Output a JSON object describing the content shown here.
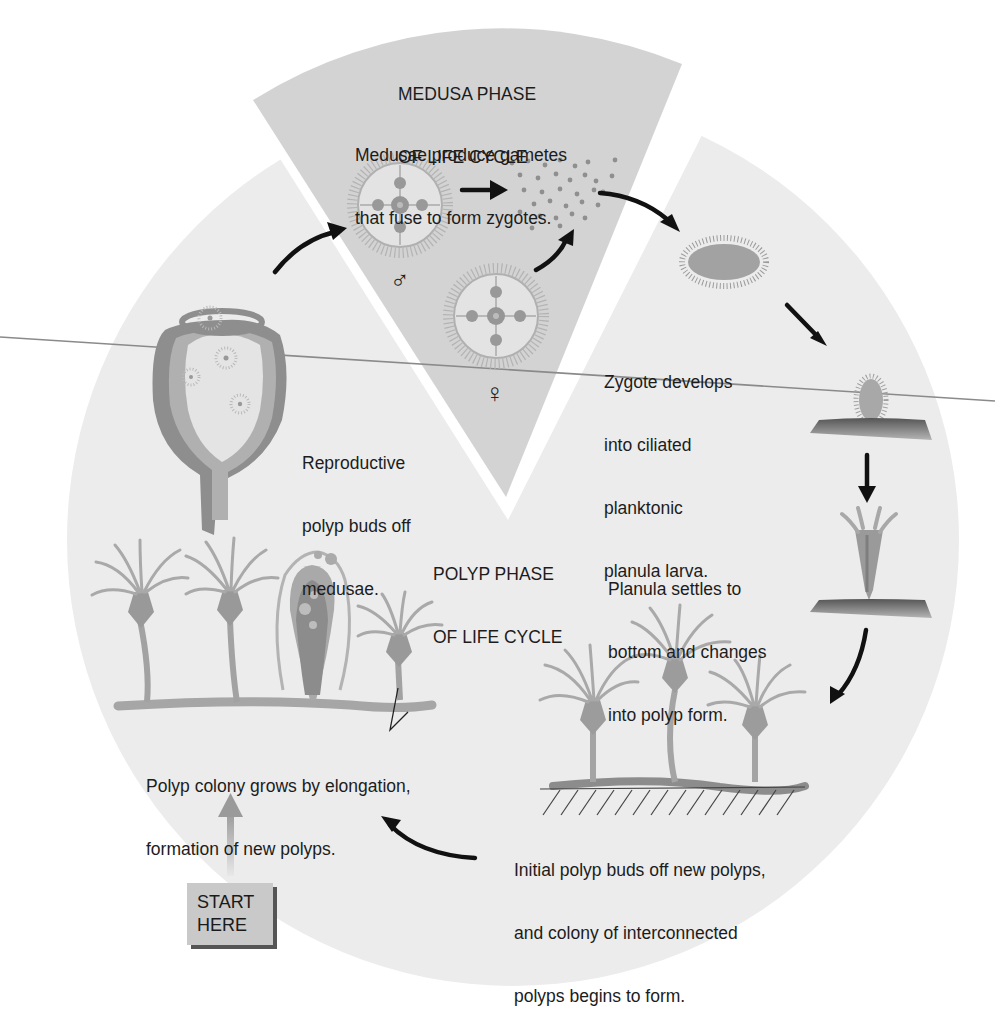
{
  "diagram": {
    "title_medusa_phase": [
      "MEDUSA PHASE",
      "OF LIFE CYCLE"
    ],
    "title_polyp_phase": [
      "POLYP PHASE",
      "OF LIFE CYCLE"
    ],
    "start_label": [
      "START",
      "HERE"
    ],
    "symbols": {
      "male": "♂",
      "female": "♀"
    },
    "captions": {
      "gametes": [
        "Medusae produce gametes",
        "that fuse to form zygotes."
      ],
      "planula": [
        "Zygote develops",
        "into ciliated",
        "planktonic",
        "planula larva."
      ],
      "reproductive_polyp": [
        "Reproductive",
        "polyp buds off",
        "medusae."
      ],
      "settles": [
        "Planula settles to",
        "bottom and changes",
        "into polyp form."
      ],
      "colony_grows": [
        "Polyp colony grows by elongation,",
        "formation of new polyps."
      ],
      "initial_polyp": [
        "Initial polyp buds off new polyps,",
        "and colony of interconnected",
        "polyps begins to form."
      ]
    },
    "stages": [
      "reproductive-polyp",
      "male-medusa",
      "female-medusa",
      "gametes-zygotes",
      "planula-larva",
      "settled-planula",
      "young-polyp",
      "initial-polyp-colony",
      "mature-polyp-colony"
    ],
    "colors": {
      "background": "#ffffff",
      "circle_fill": "#ececec",
      "medusa_wedge": "#d3d3d3",
      "organism_gray": "#a9a9a9",
      "organism_dark": "#8c8c8c",
      "arrow": "#111111",
      "start_box": "#c9c9c9",
      "stray_line": "#8a8a8a"
    }
  }
}
